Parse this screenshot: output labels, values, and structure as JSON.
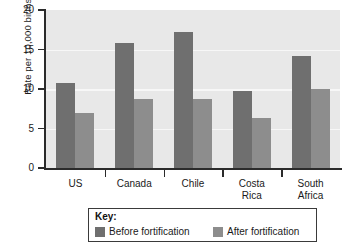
{
  "chart_data": {
    "type": "bar",
    "title": "",
    "subtitle": "",
    "xlabel": "",
    "ylabel": "Rate per 10,000 births",
    "ylim": [
      0,
      20
    ],
    "yticks": [
      0,
      5,
      10,
      15,
      20
    ],
    "ytick_labels": [
      "0",
      "5",
      "10",
      "15",
      "20"
    ],
    "grid": true,
    "grid_orientation": "horizontal",
    "legend_position": "below-plot",
    "categories": [
      "US",
      "Canada",
      "Chile",
      "Costa\nRica",
      "South\nAfrica"
    ],
    "series": [
      {
        "name": "Before fortification",
        "color": "#6f6f6f",
        "values": [
          10.8,
          15.8,
          17.2,
          9.8,
          14.2
        ]
      },
      {
        "name": "After fortification",
        "color": "#8d8d8d",
        "values": [
          7.0,
          8.7,
          8.7,
          6.3,
          10.0
        ]
      }
    ]
  },
  "legend": {
    "title": "Key:",
    "entries": [
      {
        "label": "Before fortification",
        "color": "#6f6f6f"
      },
      {
        "label": "After fortification",
        "color": "#8d8d8d"
      }
    ]
  },
  "colors": {
    "plot_background": "#e8e8e8",
    "gridline": "#f7f7f7",
    "axis": "#2b2b2b",
    "before_bar": "#6f6f6f",
    "after_bar": "#8d8d8d",
    "legend_border": "#3a3a3a",
    "page_background": "#ffffff"
  }
}
